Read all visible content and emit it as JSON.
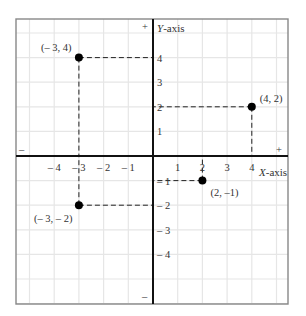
{
  "chart_data": {
    "type": "scatter",
    "title": "",
    "xlabel": "X-axis",
    "ylabel": "Y-axis",
    "xlim": [
      -5.5,
      5.5
    ],
    "ylim": [
      -6,
      5.5
    ],
    "grid": true,
    "legend": null,
    "x_ticks": [
      -4,
      -3,
      -2,
      -1,
      1,
      2,
      3,
      4
    ],
    "x_tick_labels": [
      "– 4",
      "– 3",
      "– 2",
      "– 1",
      "1",
      "2",
      "3",
      "4"
    ],
    "y_ticks": [
      4,
      3,
      2,
      1,
      -1,
      -2,
      -3,
      -4
    ],
    "y_tick_labels": [
      "4",
      "3",
      "2",
      "1",
      "– 1",
      "– 2",
      "– 3",
      "– 4"
    ],
    "axis_sign_markers": {
      "x_negative": "–",
      "x_positive": "+",
      "y_positive": "+",
      "y_negative": "–"
    },
    "points": [
      {
        "x": -3,
        "y": 4,
        "label": "(– 3, 4)"
      },
      {
        "x": 4,
        "y": 2,
        "label": "(4, 2)"
      },
      {
        "x": 2,
        "y": -1,
        "label": "(2, –1)"
      },
      {
        "x": -3,
        "y": -2,
        "label": "(– 3, – 2)"
      }
    ],
    "projection_lines": "dashed",
    "colors": {
      "grid": "#e6e6e6",
      "frame": "#888888",
      "axes": "#111111",
      "points": "#000000",
      "dash": "#222222",
      "text": "#333333"
    }
  }
}
